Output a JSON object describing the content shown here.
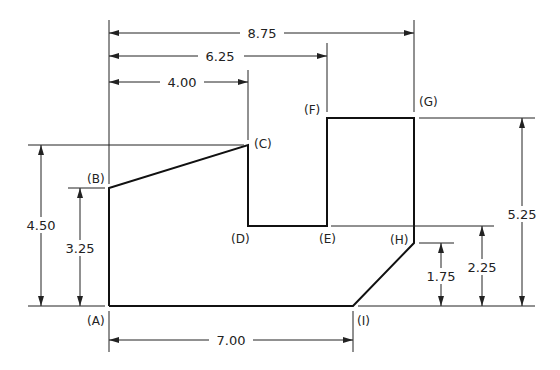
{
  "drawing": {
    "type": "dimensioned technical drawing",
    "points": {
      "A": "(A)",
      "B": "(B)",
      "C": "(C)",
      "D": "(D)",
      "E": "(E)",
      "F": "(F)",
      "G": "(G)",
      "H": "(H)",
      "I": "(I)"
    },
    "horizontal_dimensions": {
      "A_to_G": "8.75",
      "A_to_F": "6.25",
      "A_to_C": "4.00",
      "A_to_I": "7.00"
    },
    "vertical_dimensions": {
      "A_to_C_height": "4.50",
      "A_to_B_height": "3.25",
      "I_to_H_height": "1.75",
      "base_to_E_height": "2.25",
      "base_to_G_height": "5.25"
    },
    "colors": {
      "line": "#111111",
      "background": "#ffffff"
    }
  }
}
